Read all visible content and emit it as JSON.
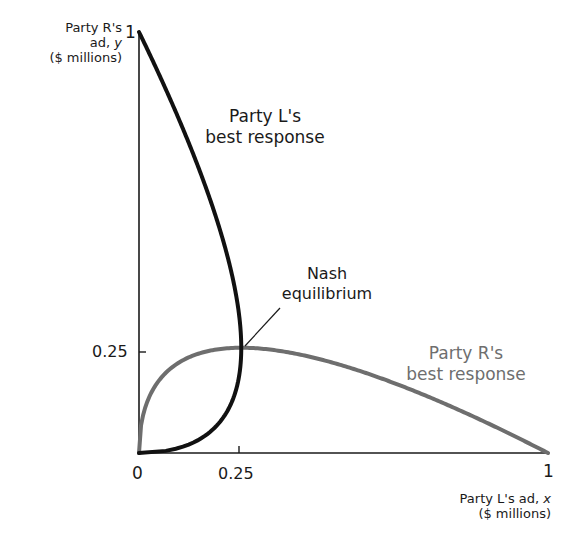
{
  "chart_data": {
    "type": "line",
    "title": "",
    "xlabel": "Party L's ad, x ($ millions)",
    "ylabel": "Party R's ad, y ($ millions)",
    "xlim": [
      0,
      1
    ],
    "ylim": [
      0,
      1
    ],
    "x_ticks": [
      "0",
      "0.25",
      "1"
    ],
    "y_ticks": [
      "0.25",
      "1"
    ],
    "grid": false,
    "legend": "none (curves labeled directly)",
    "series": [
      {
        "name": "Party L's best response",
        "color": "#111111",
        "formula": "x = sqrt(y) - y",
        "points": [
          [
            0,
            0
          ],
          [
            0.09,
            0.01
          ],
          [
            0.16,
            0.04
          ],
          [
            0.21,
            0.09
          ],
          [
            0.24,
            0.16
          ],
          [
            0.25,
            0.25
          ],
          [
            0.24,
            0.36
          ],
          [
            0.21,
            0.49
          ],
          [
            0.16,
            0.64
          ],
          [
            0.09,
            0.81
          ],
          [
            0,
            1
          ]
        ]
      },
      {
        "name": "Party R's best response",
        "color": "#6e6e6e",
        "formula": "y = sqrt(x) - x",
        "points": [
          [
            0,
            0
          ],
          [
            0.01,
            0.09
          ],
          [
            0.04,
            0.16
          ],
          [
            0.09,
            0.21
          ],
          [
            0.16,
            0.24
          ],
          [
            0.25,
            0.25
          ],
          [
            0.36,
            0.24
          ],
          [
            0.49,
            0.21
          ],
          [
            0.64,
            0.16
          ],
          [
            0.81,
            0.09
          ],
          [
            1,
            0
          ]
        ]
      }
    ],
    "annotations": [
      {
        "text": "Nash equilibrium",
        "x": 0.25,
        "y": 0.25
      }
    ]
  },
  "labels": {
    "y_axis_line1": "Party R's",
    "y_axis_line2_prefix": "ad, ",
    "y_axis_var": "y",
    "y_axis_line3": "($ millions)",
    "x_axis_line1_prefix": "Party L's ad, ",
    "x_axis_var": "x",
    "x_axis_line2": "($ millions)",
    "y_tick_1": "1",
    "y_tick_025": "0.25",
    "x_tick_0": "0",
    "x_tick_025": "0.25",
    "x_tick_1": "1",
    "l_curve_line1": "Party L's",
    "l_curve_line2": "best response",
    "r_curve_line1": "Party R's",
    "r_curve_line2": "best response",
    "nash_line1": "Nash",
    "nash_line2": "equilibrium"
  },
  "colors": {
    "l_curve": "#111111",
    "r_curve": "#6e6e6e",
    "axis": "#1a1a1a"
  }
}
